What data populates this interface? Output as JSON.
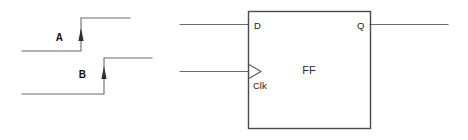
{
  "figure": {
    "kind": "digital-timing-and-flipflop-schematic",
    "background_color": "#ffffff"
  },
  "timing": {
    "signals": [
      {
        "id": "A",
        "label": "A",
        "label_x": 63,
        "label_y": 41,
        "low_y": 51,
        "high_y": 18,
        "start_x": 22,
        "edge_x": 81,
        "end_x": 130,
        "edge_direction": "rising",
        "arrow": {
          "x": 81,
          "tip_y": 28,
          "tail_y": 41,
          "glyph": "up-arrow"
        }
      },
      {
        "id": "B",
        "label": "B",
        "label_x": 86,
        "label_y": 78,
        "low_y": 94,
        "high_y": 58,
        "start_x": 22,
        "edge_x": 104,
        "end_x": 152,
        "edge_direction": "rising",
        "arrow": {
          "x": 104,
          "tip_y": 66,
          "tail_y": 79,
          "glyph": "up-arrow"
        }
      }
    ]
  },
  "flipflop": {
    "body_label": "FF",
    "box": {
      "x": 248,
      "y": 11,
      "width": 122,
      "height": 117
    },
    "pins": [
      {
        "id": "D",
        "label": "D",
        "side": "left",
        "type": "input",
        "label_x": 254,
        "label_y": 29,
        "wire": {
          "x1": 180,
          "y1": 24,
          "x2": 248,
          "y2": 24
        }
      },
      {
        "id": "Clk",
        "label": "Clk",
        "side": "left",
        "type": "clock-input",
        "label_x": 253,
        "label_y": 89,
        "wire": {
          "x1": 180,
          "y1": 71,
          "x2": 248,
          "y2": 71
        },
        "marker": "edge-triangle"
      },
      {
        "id": "Q",
        "label": "Q",
        "side": "right",
        "type": "output",
        "label_x": 357,
        "label_y": 29,
        "wire": {
          "x1": 370,
          "y1": 24,
          "x2": 448,
          "y2": 24
        }
      }
    ]
  },
  "colors": {
    "wire": "#6b6b6b",
    "box_edge": "#4a4a4a",
    "arrow": "#2e2e2e",
    "text": "#1c1c1c"
  }
}
